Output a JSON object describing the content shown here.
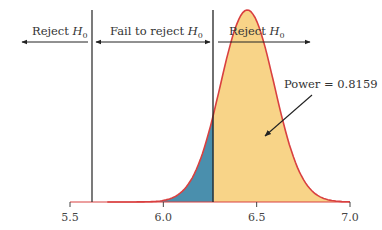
{
  "chart_data": {
    "type": "area",
    "title": "",
    "xlabel": "",
    "ylabel": "",
    "xlim": [
      5.5,
      7.0
    ],
    "xticks": [
      "5.5",
      "6.0",
      "6.5",
      "7.0"
    ],
    "grid": false,
    "distribution": {
      "name": "alternative sampling distribution",
      "mean": 6.45,
      "sd": 0.145
    },
    "critical_values": [
      5.62,
      6.27
    ],
    "regions": [
      {
        "name": "Reject H0 (left)",
        "from": 5.5,
        "to": 5.62
      },
      {
        "name": "Fail to reject H0",
        "from": 5.62,
        "to": 6.27
      },
      {
        "name": "Reject H0 (right)",
        "from": 6.27,
        "to": 7.0
      }
    ],
    "shaded": [
      {
        "name": "Type II error (beta)",
        "from": 5.9,
        "to": 6.27,
        "color": "#4a8fad"
      },
      {
        "name": "Power",
        "from": 6.27,
        "to": 7.0,
        "color": "#f8d488"
      }
    ],
    "annotations": [
      {
        "text": "Power = 0.8159",
        "arrow_to": [
          6.45,
          0.35
        ]
      }
    ],
    "power": 0.8159
  },
  "labels": {
    "reject_left": "Reject H",
    "fail_to_reject": "Fail to reject H",
    "reject_right": "Reject H",
    "subscript": "0",
    "power": "Power = 0.8159"
  },
  "colors": {
    "curve": "#d94040",
    "power_fill": "#f8d488",
    "beta_fill": "#4a8fad",
    "lines": "#333333"
  }
}
